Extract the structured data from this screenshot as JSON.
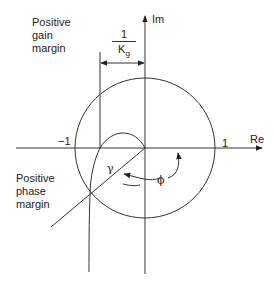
{
  "diagram": {
    "type": "nyquist-plot-stability-margins",
    "axes": {
      "x_label": "Re",
      "y_label": "Im"
    },
    "ticks": {
      "neg_one": "−1",
      "pos_one": "1"
    },
    "labels": {
      "gain_margin": [
        "Positive",
        "gain",
        "margin"
      ],
      "phase_margin": [
        "Positive",
        "phase",
        "margin"
      ],
      "inverse_gain": {
        "numerator": "1",
        "denominator": "K",
        "subscript": "g"
      },
      "gamma": "γ",
      "phi": "ϕ"
    },
    "colors": {
      "stroke": "#333333",
      "text": "#222222",
      "background": "#ffffff"
    }
  }
}
